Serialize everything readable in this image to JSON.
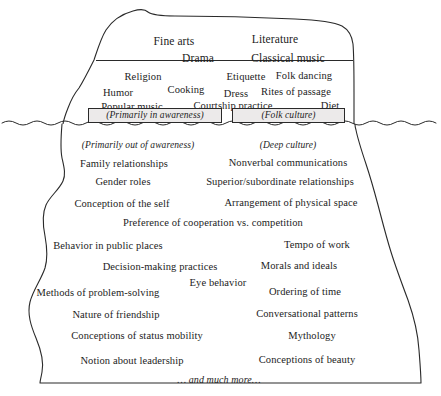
{
  "figure": {
    "kind": "cultural-iceberg-diagram",
    "background_color": "#ffffff",
    "line_color": "#2a2a2a",
    "text_color": "#1c1c1c",
    "box_fill_color": "#eceaea"
  },
  "above_water": {
    "tier1": [
      {
        "text": "Fine arts",
        "x": 174,
        "y": 36,
        "size": 11.5
      },
      {
        "text": "Literature",
        "x": 275,
        "y": 34,
        "size": 11.5
      },
      {
        "text": "Drama",
        "x": 198,
        "y": 53,
        "size": 11.5
      },
      {
        "text": "Classical music",
        "x": 288,
        "y": 53,
        "size": 11.5
      }
    ],
    "tier2": [
      {
        "text": "Religion",
        "x": 143,
        "y": 72,
        "size": 10.5
      },
      {
        "text": "Etiquette",
        "x": 246,
        "y": 72,
        "size": 10.5
      },
      {
        "text": "Folk dancing",
        "x": 304,
        "y": 71,
        "size": 10.5
      },
      {
        "text": "Humor",
        "x": 118,
        "y": 88,
        "size": 10.5
      },
      {
        "text": "Cooking",
        "x": 186,
        "y": 85,
        "size": 10.5
      },
      {
        "text": "Dress",
        "x": 236,
        "y": 89,
        "size": 10.5
      },
      {
        "text": "Rites of passage",
        "x": 296,
        "y": 87,
        "size": 10.5
      },
      {
        "text": "Popular music",
        "x": 132,
        "y": 102,
        "size": 10.5
      },
      {
        "text": "Courtship practice",
        "x": 233,
        "y": 101,
        "size": 10.5
      },
      {
        "text": "Diet",
        "x": 330,
        "y": 101,
        "size": 10.5
      }
    ]
  },
  "waterline_boxes": [
    {
      "text": "(Primarily in awareness)",
      "x": 88,
      "y": 108,
      "w": 134,
      "h": 15,
      "size": 9.5
    },
    {
      "text": "(Folk culture)",
      "x": 232,
      "y": 108,
      "w": 113,
      "h": 15,
      "size": 9.5
    }
  ],
  "below_water": {
    "captions": [
      {
        "text": "(Primarily out of awareness)",
        "x": 138,
        "y": 141,
        "size": 9.5
      },
      {
        "text": "(Deep culture)",
        "x": 288,
        "y": 141,
        "size": 9.5
      }
    ],
    "items": [
      {
        "text": "Family relationships",
        "x": 124,
        "y": 159,
        "size": 10.5
      },
      {
        "text": "Nonverbal communications",
        "x": 288,
        "y": 158,
        "size": 10.5
      },
      {
        "text": "Gender roles",
        "x": 123,
        "y": 177,
        "size": 10.5
      },
      {
        "text": "Superior/subordinate relationships",
        "x": 280,
        "y": 177,
        "size": 10.5
      },
      {
        "text": "Conception of the self",
        "x": 122,
        "y": 199,
        "size": 10.5
      },
      {
        "text": "Arrangement of physical space",
        "x": 291,
        "y": 198,
        "size": 10.5
      },
      {
        "text": "Preference of cooperation vs. competition",
        "x": 213,
        "y": 218,
        "size": 10.5
      },
      {
        "text": "Behavior in public places",
        "x": 108,
        "y": 241,
        "size": 10.5
      },
      {
        "text": "Tempo of work",
        "x": 317,
        "y": 240,
        "size": 10.5
      },
      {
        "text": "Decision-making practices",
        "x": 160,
        "y": 262,
        "size": 10.5
      },
      {
        "text": "Morals and ideals",
        "x": 299,
        "y": 261,
        "size": 10.5
      },
      {
        "text": "Eye behavior",
        "x": 218,
        "y": 278,
        "size": 10.5
      },
      {
        "text": "Methods of problem-solving",
        "x": 98,
        "y": 288,
        "size": 10.5
      },
      {
        "text": "Ordering of time",
        "x": 305,
        "y": 287,
        "size": 10.5
      },
      {
        "text": "Nature of friendship",
        "x": 116,
        "y": 310,
        "size": 10.5
      },
      {
        "text": "Conversational patterns",
        "x": 307,
        "y": 309,
        "size": 10.5
      },
      {
        "text": "Conceptions of status mobility",
        "x": 137,
        "y": 331,
        "size": 10.5
      },
      {
        "text": "Mythology",
        "x": 312,
        "y": 331,
        "size": 10.5
      },
      {
        "text": "Notion about leadership",
        "x": 132,
        "y": 356,
        "size": 10.5
      },
      {
        "text": "Conceptions of beauty",
        "x": 307,
        "y": 355,
        "size": 10.5
      }
    ],
    "footer": {
      "text": "… and much more…",
      "x": 219,
      "y": 375,
      "size": 10
    }
  }
}
